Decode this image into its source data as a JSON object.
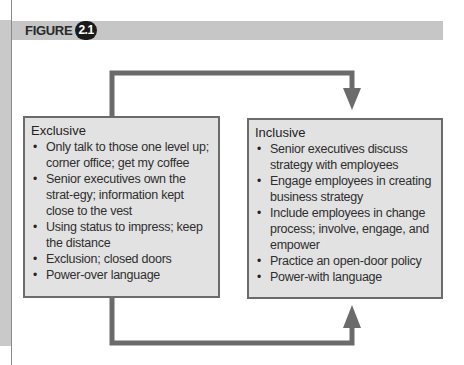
{
  "figure": {
    "label": "FIGURE",
    "number": "2.1"
  },
  "colors": {
    "box_fill": "#e2e2e2",
    "box_border": "#6b6b6b",
    "arrow": "#6b6b6b",
    "header_bar": "#c6c6c6",
    "badge": "#1a1a1a"
  },
  "exclusive": {
    "title": "Exclusive",
    "items": [
      "Only talk to those one level up; corner office; get my coffee",
      "Senior executives own the strat-egy; information kept close to the vest",
      "Using status to impress; keep the distance",
      "Exclusion; closed doors",
      "Power-over language"
    ]
  },
  "inclusive": {
    "title": "Inclusive",
    "items": [
      "Senior executives discuss strategy with employees",
      "Engage employees in creating business strategy",
      "Include employees in change process; involve, engage, and empower",
      "Practice an open-door policy",
      "Power-with language"
    ]
  },
  "connectors": {
    "top_arrow": "Exclusive → Inclusive (top loop, arrow pointing down)",
    "bottom_arrow": "Exclusive → Inclusive (bottom loop, arrow pointing up)"
  }
}
